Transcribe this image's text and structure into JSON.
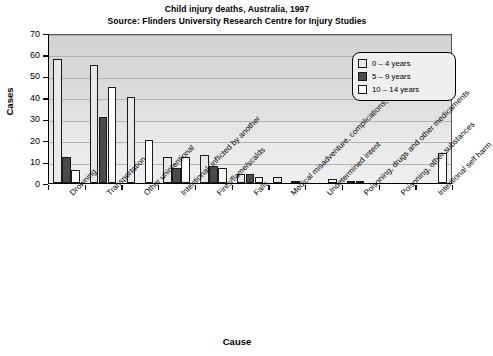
{
  "title": {
    "line1": "Child injury deaths, Australia, 1997",
    "line2": "Source: Flinders University Research Centre for Injury Studies"
  },
  "axes": {
    "ylabel": "Cases",
    "xlabel": "Cause",
    "yticks": [
      "70",
      "60",
      "50",
      "40",
      "30",
      "20",
      "10",
      "0"
    ]
  },
  "legend": {
    "items": [
      {
        "label": "0 – 4 years",
        "color": "#e8e8e8"
      },
      {
        "label": "5 – 9 years",
        "color": "#4a4a4a"
      },
      {
        "label": "10 – 14 years",
        "color": "#ffffff"
      }
    ]
  },
  "chart_data": {
    "type": "bar",
    "title": "Child injury deaths, Australia, 1997",
    "subtitle": "Source: Flinders University Research Centre for Injury Studies",
    "xlabel": "Cause",
    "ylabel": "Cases",
    "ylim": [
      0,
      70
    ],
    "ytick_step": 10,
    "grid": true,
    "legend_position": "top-right",
    "categories": [
      "Drowning",
      "Transportation",
      "Other unintentional",
      "Intentional, inflicted by another",
      "Fires/flame/scalds",
      "Falls",
      "Medical misadventure, complications, etc.",
      "Undetermined intent",
      "Poisoning, drugs and other medicaments",
      "Poisoning, other substances",
      "Intentional self harm"
    ],
    "series": [
      {
        "name": "0 – 4 years",
        "values": [
          58,
          55,
          40,
          12,
          13,
          4,
          3,
          0,
          1,
          0,
          0
        ]
      },
      {
        "name": "5 – 9 years",
        "values": [
          12,
          31,
          0,
          7,
          8,
          4,
          0,
          0,
          1,
          0,
          0
        ]
      },
      {
        "name": "10 – 14 years",
        "values": [
          6,
          45,
          20,
          12,
          7,
          3,
          1,
          2,
          0,
          0,
          14
        ]
      }
    ]
  }
}
